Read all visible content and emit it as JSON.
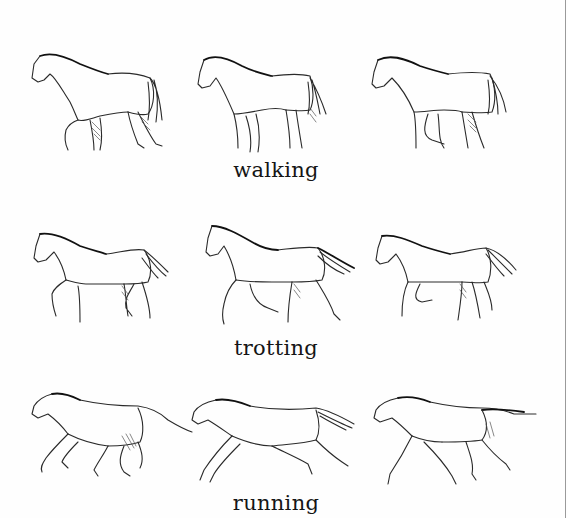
{
  "figure": {
    "rows": [
      {
        "gait": "walking",
        "label": "walking",
        "horse_count": 3
      },
      {
        "gait": "trotting",
        "label": "trotting",
        "horse_count": 3
      },
      {
        "gait": "running",
        "label": "running",
        "horse_count": 3
      }
    ],
    "colors": {
      "background": "#fefefe",
      "ink": "#2a2a2a",
      "border": "#9a9a9a"
    }
  }
}
